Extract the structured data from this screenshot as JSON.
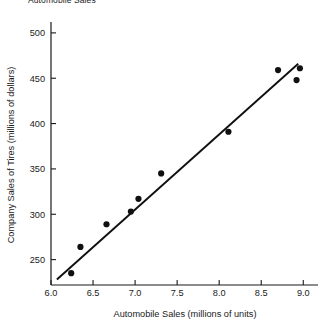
{
  "figure": {
    "title_partial": "Automobile Sales",
    "background_color": "#ffffff",
    "ink_color": "#1a1a1a"
  },
  "chart_data": {
    "type": "scatter",
    "title": "Automobile Sales",
    "xlabel": "Automobile Sales (millions of units)",
    "ylabel": "Company Sales of Tires (millions of dollars)",
    "xlim": [
      6.0,
      9.08
    ],
    "ylim": [
      222,
      512
    ],
    "xticks": [
      6.0,
      6.5,
      7.0,
      7.5,
      8.0,
      8.5,
      9.0
    ],
    "xticklabels": [
      "6.0",
      "6.5",
      "7.0",
      "7.5",
      "8.0",
      "8.5",
      "9.0"
    ],
    "yticks": [
      250,
      300,
      350,
      400,
      450,
      500
    ],
    "yticklabels": [
      "250",
      "300",
      "350",
      "400",
      "450",
      "500"
    ],
    "grid": false,
    "legend": null,
    "marker_color": "#101010",
    "marker_size": 3.1,
    "points": [
      {
        "x": 6.24,
        "y": 235
      },
      {
        "x": 6.35,
        "y": 264
      },
      {
        "x": 6.66,
        "y": 289
      },
      {
        "x": 6.95,
        "y": 303
      },
      {
        "x": 7.04,
        "y": 317
      },
      {
        "x": 7.31,
        "y": 345
      },
      {
        "x": 8.11,
        "y": 391
      },
      {
        "x": 8.7,
        "y": 459
      },
      {
        "x": 8.92,
        "y": 448
      },
      {
        "x": 8.96,
        "y": 461
      }
    ],
    "trend_line": {
      "type": "linear-fit",
      "color": "#101010",
      "width": 1.9,
      "x_start": 6.07,
      "y_start": 228,
      "x_end": 8.94,
      "y_end": 466
    }
  }
}
